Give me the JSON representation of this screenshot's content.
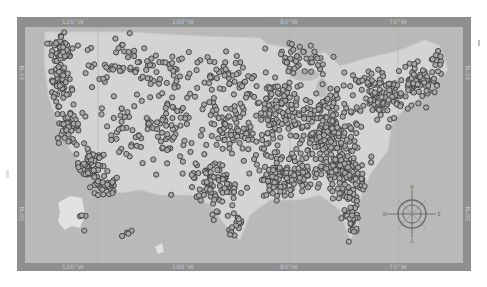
{
  "map": {
    "title": "",
    "colors": {
      "frame": "#8f8f8f",
      "ocean": "#b9b9b9",
      "land": "#cfcfcf",
      "land_light": "#dedede",
      "marker_stroke": "#3a3a3a",
      "marker_fill": "#a8a8a8"
    },
    "longitude_labels_top": [
      {
        "label": "120°W",
        "x": 73
      },
      {
        "label": "100°W",
        "x": 183
      },
      {
        "label": "80°W",
        "x": 289
      },
      {
        "label": "70°W",
        "x": 398
      }
    ],
    "longitude_labels_bottom": [
      {
        "label": "120°W",
        "x": 73
      },
      {
        "label": "100°W",
        "x": 183
      },
      {
        "label": "80°W",
        "x": 289
      },
      {
        "label": "70°W",
        "x": 398
      }
    ],
    "latitude_labels_left": [
      {
        "label": "45°N",
        "y": 73
      },
      {
        "label": "30°N",
        "y": 214
      }
    ],
    "latitude_labels_right": [
      {
        "label": "45°N",
        "y": 73
      },
      {
        "label": "30°N",
        "y": 214
      }
    ],
    "compass": {
      "x": 412,
      "y": 214,
      "r": 14,
      "labels": [
        "N",
        "E",
        "S",
        "W"
      ]
    },
    "insets": [
      "Alaska",
      "Hawaii"
    ],
    "marker_radius": 2.6,
    "clusters": [
      {
        "cx": 62,
        "cy": 50,
        "sx": 8,
        "sy": 10,
        "n": 55
      },
      {
        "cx": 60,
        "cy": 85,
        "sx": 7,
        "sy": 14,
        "n": 45
      },
      {
        "cx": 70,
        "cy": 125,
        "sx": 8,
        "sy": 14,
        "n": 60
      },
      {
        "cx": 90,
        "cy": 165,
        "sx": 10,
        "sy": 10,
        "n": 55
      },
      {
        "cx": 105,
        "cy": 185,
        "sx": 9,
        "sy": 7,
        "n": 35
      },
      {
        "cx": 110,
        "cy": 60,
        "sx": 22,
        "sy": 18,
        "n": 40
      },
      {
        "cx": 125,
        "cy": 130,
        "sx": 22,
        "sy": 25,
        "n": 45
      },
      {
        "cx": 160,
        "cy": 70,
        "sx": 20,
        "sy": 20,
        "n": 45
      },
      {
        "cx": 170,
        "cy": 135,
        "sx": 20,
        "sy": 25,
        "n": 55
      },
      {
        "cx": 215,
        "cy": 185,
        "sx": 18,
        "sy": 20,
        "n": 90
      },
      {
        "cx": 235,
        "cy": 225,
        "sx": 6,
        "sy": 10,
        "n": 14
      },
      {
        "cx": 220,
        "cy": 80,
        "sx": 22,
        "sy": 20,
        "n": 55
      },
      {
        "cx": 230,
        "cy": 130,
        "sx": 20,
        "sy": 20,
        "n": 70
      },
      {
        "cx": 275,
        "cy": 110,
        "sx": 22,
        "sy": 28,
        "n": 130
      },
      {
        "cx": 285,
        "cy": 175,
        "sx": 22,
        "sy": 18,
        "n": 120
      },
      {
        "cx": 330,
        "cy": 130,
        "sx": 22,
        "sy": 30,
        "n": 200
      },
      {
        "cx": 345,
        "cy": 175,
        "sx": 18,
        "sy": 14,
        "n": 100
      },
      {
        "cx": 350,
        "cy": 220,
        "sx": 6,
        "sy": 16,
        "n": 35
      },
      {
        "cx": 385,
        "cy": 95,
        "sx": 22,
        "sy": 16,
        "n": 120
      },
      {
        "cx": 420,
        "cy": 80,
        "sx": 14,
        "sy": 10,
        "n": 60
      },
      {
        "cx": 437,
        "cy": 60,
        "sx": 4,
        "sy": 8,
        "n": 10
      },
      {
        "cx": 300,
        "cy": 60,
        "sx": 18,
        "sy": 12,
        "n": 40
      },
      {
        "cx": 80,
        "cy": 222,
        "sx": 3,
        "sy": 12,
        "n": 4
      },
      {
        "cx": 125,
        "cy": 233,
        "sx": 12,
        "sy": 3,
        "n": 4
      }
    ]
  }
}
